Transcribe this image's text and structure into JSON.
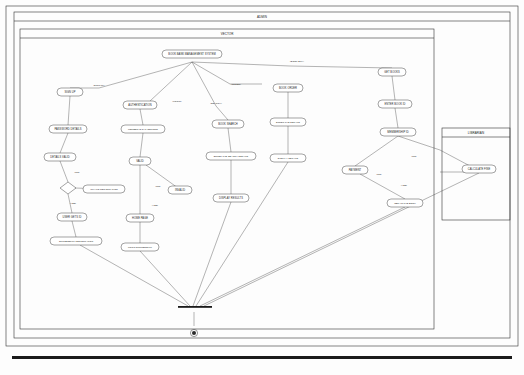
{
  "diagram": {
    "outer_frame_label": "ADMIN",
    "swimlanes": [
      {
        "id": "vector",
        "label": "VECTOR"
      },
      {
        "id": "librarian",
        "label": "LIBRARIAN"
      }
    ],
    "nodes": [
      {
        "id": "n1",
        "label": "BOOK BANK MANAGEMENT SYSTEM",
        "shape": "rounded",
        "x": 192,
        "y": 54,
        "w": 60,
        "h": 8
      },
      {
        "id": "n2",
        "label": "SIGN UP",
        "shape": "rounded",
        "x": 70,
        "y": 92,
        "w": 26,
        "h": 8
      },
      {
        "id": "n3",
        "label": "AUTHENTICATION",
        "shape": "rounded",
        "x": 140,
        "y": 105,
        "w": 34,
        "h": 8
      },
      {
        "id": "n4",
        "label": "BOOK ORDER",
        "shape": "rounded",
        "x": 288,
        "y": 88,
        "w": 30,
        "h": 8
      },
      {
        "id": "n5",
        "label": "GET BOOKS",
        "shape": "rounded",
        "x": 392,
        "y": 72,
        "w": 28,
        "h": 8
      },
      {
        "id": "n6",
        "label": "PASSWORD DETAILS",
        "shape": "rounded",
        "x": 68,
        "y": 129,
        "w": 38,
        "h": 8
      },
      {
        "id": "n7",
        "label": "MEMBER ID & PASSWORD",
        "shape": "rounded",
        "x": 143,
        "y": 129,
        "w": 44,
        "h": 8
      },
      {
        "id": "n8",
        "label": "BOOK SEARCH",
        "shape": "rounded",
        "x": 228,
        "y": 124,
        "w": 32,
        "h": 8
      },
      {
        "id": "n9",
        "label": "ENTER THE DETAILS",
        "shape": "rounded",
        "x": 288,
        "y": 122,
        "w": 36,
        "h": 8
      },
      {
        "id": "n10",
        "label": "ENTER BOOK ID",
        "shape": "rounded",
        "x": 395,
        "y": 104,
        "w": 34,
        "h": 8
      },
      {
        "id": "n11",
        "label": "DETAILS VALID",
        "shape": "rounded",
        "x": 60,
        "y": 157,
        "w": 32,
        "h": 8
      },
      {
        "id": "n12",
        "label": "VALID",
        "shape": "rounded",
        "x": 140,
        "y": 161,
        "w": 22,
        "h": 8
      },
      {
        "id": "n13",
        "label": "ENTER THE SEARCH DETAILS",
        "shape": "rounded",
        "x": 231,
        "y": 156,
        "w": 50,
        "h": 8
      },
      {
        "id": "n14",
        "label": "DISPLAY DETAILS",
        "shape": "rounded",
        "x": 288,
        "y": 158,
        "w": 36,
        "h": 8
      },
      {
        "id": "n15",
        "label": "MEMBERSHIP ID",
        "shape": "rounded",
        "x": 398,
        "y": 132,
        "w": 36,
        "h": 8
      },
      {
        "id": "n16",
        "label": "INVALID REGISTRATION",
        "shape": "rounded",
        "x": 104,
        "y": 189,
        "w": 42,
        "h": 8
      },
      {
        "id": "n17",
        "label": "INVALID",
        "shape": "rounded",
        "x": 180,
        "y": 190,
        "w": 24,
        "h": 8
      },
      {
        "id": "n18",
        "label": "DISPLAY RESULTS",
        "shape": "rounded",
        "x": 231,
        "y": 198,
        "w": 36,
        "h": 8
      },
      {
        "id": "n19",
        "label": "USER GETS ID",
        "shape": "rounded",
        "x": 72,
        "y": 217,
        "w": 30,
        "h": 8
      },
      {
        "id": "n20",
        "label": "HOME PAGE",
        "shape": "rounded",
        "x": 140,
        "y": 218,
        "w": 28,
        "h": 8
      },
      {
        "id": "n21",
        "label": "SUCCESSFUL REGISTRATION",
        "shape": "rounded",
        "x": 76,
        "y": 241,
        "w": 52,
        "h": 8
      },
      {
        "id": "n22",
        "label": "LOGIN SUCCESSFUL",
        "shape": "rounded",
        "x": 140,
        "y": 247,
        "w": 38,
        "h": 8
      },
      {
        "id": "n23",
        "label": "PAYMENT",
        "shape": "rounded",
        "x": 355,
        "y": 170,
        "w": 26,
        "h": 8
      },
      {
        "id": "n24",
        "label": "OBTAIN THE BOOK",
        "shape": "rounded",
        "x": 405,
        "y": 203,
        "w": 36,
        "h": 8
      },
      {
        "id": "n25",
        "label": "CALCULATE FINE",
        "shape": "rounded",
        "x": 479,
        "y": 169,
        "w": 34,
        "h": 8
      },
      {
        "id": "d1",
        "label": "",
        "shape": "diamond",
        "x": 68,
        "y": 188,
        "w": 14,
        "h": 8
      }
    ],
    "edge_labels": [
      {
        "id": "e1",
        "label": "[SIGN UP]",
        "x": 99,
        "y": 88
      },
      {
        "id": "e2",
        "label": "[LOGIN]",
        "x": 177,
        "y": 101
      },
      {
        "id": "e3",
        "label": "[SEARCH]",
        "x": 216,
        "y": 103
      },
      {
        "id": "e4",
        "label": "[ORDER]",
        "x": 236,
        "y": 86
      },
      {
        "id": "e5",
        "label": "[BOOK BUY]",
        "x": 297,
        "y": 62
      },
      {
        "id": "e6",
        "label": "[NO]",
        "x": 77,
        "y": 172
      },
      {
        "id": "e7",
        "label": "[YES]",
        "x": 73,
        "y": 203
      },
      {
        "id": "e8",
        "label": "[NO]",
        "x": 158,
        "y": 186
      },
      {
        "id": "e9",
        "label": "[YES]",
        "x": 155,
        "y": 205
      },
      {
        "id": "e10",
        "label": "[NO]",
        "x": 414,
        "y": 156
      },
      {
        "id": "e11",
        "label": "[NO]",
        "x": 379,
        "y": 174
      },
      {
        "id": "e12",
        "label": "[YES]",
        "x": 404,
        "y": 185
      }
    ],
    "edges": [
      {
        "from": "start",
        "to": "n1"
      },
      {
        "from": "n1",
        "to": "n2"
      },
      {
        "from": "n1",
        "to": "n3"
      },
      {
        "from": "n1",
        "to": "n4"
      },
      {
        "from": "n1",
        "to": "n5"
      },
      {
        "from": "n1",
        "to": "n8"
      },
      {
        "from": "n2",
        "to": "n6"
      },
      {
        "from": "n3",
        "to": "n7"
      },
      {
        "from": "n4",
        "to": "n9"
      },
      {
        "from": "n5",
        "to": "n10"
      },
      {
        "from": "n6",
        "to": "n11"
      },
      {
        "from": "n7",
        "to": "n12"
      },
      {
        "from": "n8",
        "to": "n13"
      },
      {
        "from": "n9",
        "to": "n14"
      },
      {
        "from": "n10",
        "to": "n15"
      },
      {
        "from": "n11",
        "to": "d1"
      },
      {
        "from": "d1",
        "to": "n16",
        "label": "[NO]"
      },
      {
        "from": "d1",
        "to": "n19",
        "label": "[YES]"
      },
      {
        "from": "n12",
        "to": "n17",
        "label": "[NO]"
      },
      {
        "from": "n12",
        "to": "n20",
        "label": "[YES]"
      },
      {
        "from": "n13",
        "to": "n18"
      },
      {
        "from": "n19",
        "to": "n21"
      },
      {
        "from": "n20",
        "to": "n22"
      },
      {
        "from": "n15",
        "to": "n23"
      },
      {
        "from": "n23",
        "to": "n24",
        "label": "[YES]"
      },
      {
        "from": "n23",
        "to": "n25",
        "label": "[NO]"
      },
      {
        "from": "n21",
        "to": "end"
      },
      {
        "from": "n22",
        "to": "end"
      },
      {
        "from": "n18",
        "to": "end"
      },
      {
        "from": "n14",
        "to": "end"
      },
      {
        "from": "n24",
        "to": "end"
      },
      {
        "from": "n25",
        "to": "end"
      }
    ],
    "markers": {
      "join_bar": "synchronization-bar",
      "start_node": "initial-node",
      "end_node": "final-node"
    }
  }
}
